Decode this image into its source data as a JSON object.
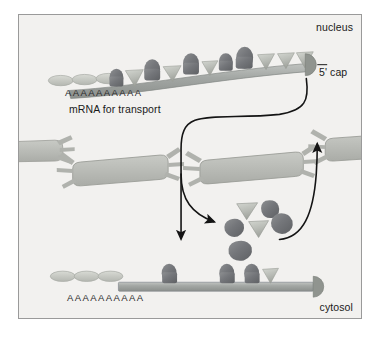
{
  "figure": {
    "panel": {
      "background_color": "#f2f1ef",
      "border_color": "#9a9a9a"
    }
  },
  "labels": {
    "nucleus": "nucleus",
    "cytosol": "cytosol",
    "five_prime_cap": "5' cap",
    "mrna_for_transport": "mRNA for transport",
    "poly_a_tail_top": "AAAAAAAAAA",
    "poly_a_tail_bottom": "AAAAAAAAAA"
  },
  "colors": {
    "mrna_strand": "#9a9e9c",
    "mrna_strand_highlight": "#b9bdba",
    "protein_dark": "#77787a",
    "protein_light": "#b9bcb6",
    "cap": "#8d9190",
    "pore": "#b5b7b2",
    "pore_inner": "#c9cbc6",
    "arrow": "#141414",
    "poly_a_oval": "#c3c5bf",
    "text": "#1a1a1a"
  },
  "top_mrna": {
    "description": "mRNA in nucleus coated with alternating dark blob proteins and light cone proteins",
    "poly_a_ovals": 3,
    "proteins": [
      {
        "type": "blob",
        "shade": "dark"
      },
      {
        "type": "cone",
        "shade": "light"
      },
      {
        "type": "blob",
        "shade": "dark"
      },
      {
        "type": "cone",
        "shade": "light"
      },
      {
        "type": "blob",
        "shade": "dark"
      },
      {
        "type": "cone",
        "shade": "light"
      },
      {
        "type": "blob",
        "shade": "dark"
      },
      {
        "type": "blob",
        "shade": "dark"
      },
      {
        "type": "blob",
        "shade": "dark"
      },
      {
        "type": "cone",
        "shade": "light"
      },
      {
        "type": "cone",
        "shade": "light"
      },
      {
        "type": "cone",
        "shade": "light"
      }
    ],
    "has_cap": true
  },
  "bottom_mrna": {
    "description": "mRNA in cytosol with most proteins stripped off",
    "poly_a_ovals": 3,
    "proteins": [
      {
        "type": "blob",
        "shade": "dark"
      },
      {
        "type": "blob",
        "shade": "dark"
      },
      {
        "type": "blob",
        "shade": "dark"
      },
      {
        "type": "cone",
        "shade": "light"
      }
    ],
    "has_cap": true
  },
  "nuclear_pores": [
    {
      "name": "pore-left-edge",
      "position": "left-cut-off"
    },
    {
      "name": "pore-left-center",
      "position": "left-center"
    },
    {
      "name": "pore-center",
      "position": "center"
    },
    {
      "name": "pore-right",
      "position": "right"
    }
  ],
  "released_proteins": [
    {
      "type": "cone",
      "shade": "light"
    },
    {
      "type": "blob",
      "shade": "dark"
    },
    {
      "type": "blob",
      "shade": "dark"
    },
    {
      "type": "cone",
      "shade": "light"
    },
    {
      "type": "blob",
      "shade": "dark"
    },
    {
      "type": "blob",
      "shade": "dark"
    }
  ],
  "arrows": [
    {
      "name": "export-arrow",
      "from": "5' cap of nuclear mRNA",
      "to": "cytosolic mRNA",
      "direction": "down"
    },
    {
      "name": "protein-release-arrow",
      "from": "export path",
      "to": "released protein cluster",
      "direction": "down-right"
    },
    {
      "name": "protein-recycle-arrow",
      "from": "released protein cluster",
      "to": "nuclear pore",
      "direction": "up-right"
    }
  ]
}
